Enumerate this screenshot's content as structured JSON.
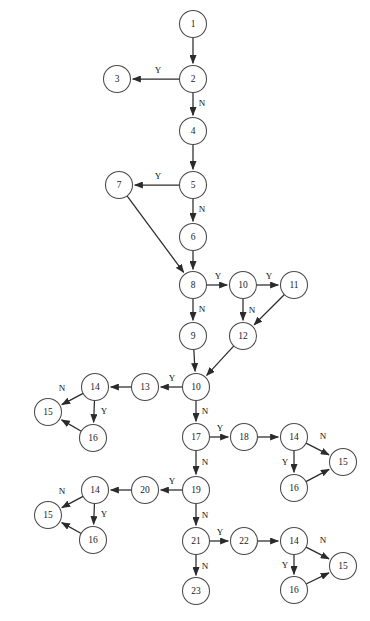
{
  "diagram": {
    "type": "flowchart",
    "canvas": {
      "width": 370,
      "height": 621
    },
    "node_radius": 13.5,
    "colors": {
      "node_stroke": "#4a4a4a",
      "node_fill": "#ffffff",
      "edge": "#2b2b2b",
      "text": "#1a1a1a",
      "background": "#ffffff"
    },
    "nodes": [
      {
        "id": "n1",
        "label": "1",
        "x": 193,
        "y": 24
      },
      {
        "id": "n2",
        "label": "2",
        "x": 193,
        "y": 79
      },
      {
        "id": "n3",
        "label": "3",
        "x": 117,
        "y": 79
      },
      {
        "id": "n4",
        "label": "4",
        "x": 193,
        "y": 131
      },
      {
        "id": "n5",
        "label": "5",
        "x": 193,
        "y": 185
      },
      {
        "id": "n7",
        "label": "7",
        "x": 119,
        "y": 185
      },
      {
        "id": "n6",
        "label": "6",
        "x": 193,
        "y": 237
      },
      {
        "id": "n8",
        "label": "8",
        "x": 193,
        "y": 285
      },
      {
        "id": "n10a",
        "label": "10",
        "x": 243,
        "y": 285
      },
      {
        "id": "n11",
        "label": "11",
        "x": 294,
        "y": 285
      },
      {
        "id": "n9",
        "label": "9",
        "x": 193,
        "y": 336
      },
      {
        "id": "n12",
        "label": "12",
        "x": 243,
        "y": 336
      },
      {
        "id": "n10b",
        "label": "10",
        "x": 196,
        "y": 387
      },
      {
        "id": "n13",
        "label": "13",
        "x": 145,
        "y": 387
      },
      {
        "id": "n14a",
        "label": "14",
        "x": 95,
        "y": 387
      },
      {
        "id": "n15a",
        "label": "15",
        "x": 48,
        "y": 412
      },
      {
        "id": "n16a",
        "label": "16",
        "x": 93,
        "y": 438
      },
      {
        "id": "n17",
        "label": "17",
        "x": 196,
        "y": 437
      },
      {
        "id": "n18",
        "label": "18",
        "x": 244,
        "y": 437
      },
      {
        "id": "n14b",
        "label": "14",
        "x": 294,
        "y": 437
      },
      {
        "id": "n15b",
        "label": "15",
        "x": 343,
        "y": 462
      },
      {
        "id": "n16b",
        "label": "16",
        "x": 294,
        "y": 488
      },
      {
        "id": "n19",
        "label": "19",
        "x": 196,
        "y": 490
      },
      {
        "id": "n20",
        "label": "20",
        "x": 145,
        "y": 490
      },
      {
        "id": "n14c",
        "label": "14",
        "x": 95,
        "y": 490
      },
      {
        "id": "n15c",
        "label": "15",
        "x": 48,
        "y": 515
      },
      {
        "id": "n16c",
        "label": "16",
        "x": 93,
        "y": 540
      },
      {
        "id": "n21",
        "label": "21",
        "x": 196,
        "y": 541
      },
      {
        "id": "n22",
        "label": "22",
        "x": 244,
        "y": 541
      },
      {
        "id": "n14d",
        "label": "14",
        "x": 294,
        "y": 541
      },
      {
        "id": "n15d",
        "label": "15",
        "x": 343,
        "y": 566
      },
      {
        "id": "n16d",
        "label": "16",
        "x": 294,
        "y": 590
      },
      {
        "id": "n23",
        "label": "23",
        "x": 196,
        "y": 591
      }
    ],
    "edges": [
      {
        "from": "n1",
        "to": "n2",
        "label": "",
        "label_x": 0,
        "label_y": 0
      },
      {
        "from": "n2",
        "to": "n3",
        "label": "Y",
        "label_x": 158,
        "label_y": 71
      },
      {
        "from": "n2",
        "to": "n4",
        "label": "N",
        "label_x": 202,
        "label_y": 104
      },
      {
        "from": "n4",
        "to": "n5",
        "label": "",
        "label_x": 0,
        "label_y": 0
      },
      {
        "from": "n5",
        "to": "n7",
        "label": "Y",
        "label_x": 158,
        "label_y": 177
      },
      {
        "from": "n5",
        "to": "n6",
        "label": "N",
        "label_x": 202,
        "label_y": 210
      },
      {
        "from": "n7",
        "to": "n8",
        "label": "",
        "label_x": 0,
        "label_y": 0
      },
      {
        "from": "n6",
        "to": "n8",
        "label": "",
        "label_x": 0,
        "label_y": 0
      },
      {
        "from": "n8",
        "to": "n10a",
        "label": "Y",
        "label_x": 218,
        "label_y": 277
      },
      {
        "from": "n8",
        "to": "n9",
        "label": "N",
        "label_x": 202,
        "label_y": 310
      },
      {
        "from": "n10a",
        "to": "n11",
        "label": "Y",
        "label_x": 269,
        "label_y": 277
      },
      {
        "from": "n10a",
        "to": "n12",
        "label": "N",
        "label_x": 252,
        "label_y": 311
      },
      {
        "from": "n11",
        "to": "n12",
        "label": "",
        "label_x": 0,
        "label_y": 0
      },
      {
        "from": "n9",
        "to": "n10b",
        "label": "",
        "label_x": 0,
        "label_y": 0
      },
      {
        "from": "n12",
        "to": "n10b",
        "label": "",
        "label_x": 0,
        "label_y": 0
      },
      {
        "from": "n10b",
        "to": "n13",
        "label": "Y",
        "label_x": 172,
        "label_y": 379
      },
      {
        "from": "n10b",
        "to": "n17",
        "label": "N",
        "label_x": 205,
        "label_y": 412
      },
      {
        "from": "n13",
        "to": "n14a",
        "label": "",
        "label_x": 0,
        "label_y": 0
      },
      {
        "from": "n14a",
        "to": "n15a",
        "label": "N",
        "label_x": 62,
        "label_y": 389
      },
      {
        "from": "n14a",
        "to": "n16a",
        "label": "Y",
        "label_x": 104,
        "label_y": 412
      },
      {
        "from": "n16a",
        "to": "n15a",
        "label": "",
        "label_x": 0,
        "label_y": 0
      },
      {
        "from": "n17",
        "to": "n18",
        "label": "Y",
        "label_x": 220,
        "label_y": 429
      },
      {
        "from": "n17",
        "to": "n19",
        "label": "N",
        "label_x": 205,
        "label_y": 463
      },
      {
        "from": "n18",
        "to": "n14b",
        "label": "",
        "label_x": 0,
        "label_y": 0
      },
      {
        "from": "n14b",
        "to": "n15b",
        "label": "N",
        "label_x": 323,
        "label_y": 437
      },
      {
        "from": "n14b",
        "to": "n16b",
        "label": "Y",
        "label_x": 285,
        "label_y": 463
      },
      {
        "from": "n16b",
        "to": "n15b",
        "label": "",
        "label_x": 0,
        "label_y": 0
      },
      {
        "from": "n19",
        "to": "n20",
        "label": "Y",
        "label_x": 172,
        "label_y": 482
      },
      {
        "from": "n19",
        "to": "n21",
        "label": "N",
        "label_x": 205,
        "label_y": 516
      },
      {
        "from": "n20",
        "to": "n14c",
        "label": "",
        "label_x": 0,
        "label_y": 0
      },
      {
        "from": "n14c",
        "to": "n15c",
        "label": "N",
        "label_x": 62,
        "label_y": 492
      },
      {
        "from": "n14c",
        "to": "n16c",
        "label": "Y",
        "label_x": 104,
        "label_y": 515
      },
      {
        "from": "n16c",
        "to": "n15c",
        "label": "",
        "label_x": 0,
        "label_y": 0
      },
      {
        "from": "n21",
        "to": "n22",
        "label": "Y",
        "label_x": 220,
        "label_y": 533
      },
      {
        "from": "n21",
        "to": "n23",
        "label": "N",
        "label_x": 205,
        "label_y": 567
      },
      {
        "from": "n22",
        "to": "n14d",
        "label": "",
        "label_x": 0,
        "label_y": 0
      },
      {
        "from": "n14d",
        "to": "n15d",
        "label": "N",
        "label_x": 323,
        "label_y": 541
      },
      {
        "from": "n14d",
        "to": "n16d",
        "label": "Y",
        "label_x": 285,
        "label_y": 566
      },
      {
        "from": "n16d",
        "to": "n15d",
        "label": "",
        "label_x": 0,
        "label_y": 0
      }
    ]
  }
}
